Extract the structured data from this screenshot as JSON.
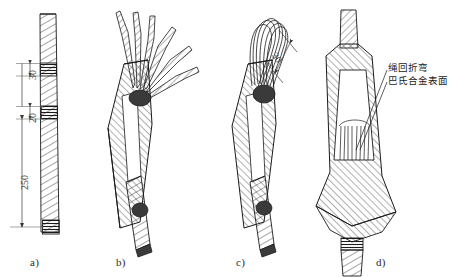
{
  "figure": {
    "background_color": "#ffffff",
    "line_color": "#1a1a1a",
    "panels": [
      {
        "id": "a",
        "label": "a)",
        "caption_x": 30,
        "caption_y": 256
      },
      {
        "id": "b",
        "label": "b)",
        "caption_x": 116,
        "caption_y": 256
      },
      {
        "id": "c",
        "label": "c)",
        "caption_x": 236,
        "caption_y": 256
      },
      {
        "id": "d",
        "label": "d)",
        "caption_x": 376,
        "caption_y": 256
      }
    ],
    "dimensions": [
      {
        "id": "dim-30-top",
        "value": "30",
        "panel": "a",
        "orientation": "vertical"
      },
      {
        "id": "dim-20",
        "value": "20",
        "panel": "a",
        "orientation": "vertical"
      },
      {
        "id": "dim-250",
        "value": "250",
        "panel": "a",
        "orientation": "vertical"
      },
      {
        "id": "dim-30-loop",
        "value": "30",
        "panel": "c",
        "orientation": "diagonal"
      }
    ],
    "annotations": [
      {
        "id": "note-rope-bend",
        "text": "绳回折弯",
        "panel": "d"
      },
      {
        "id": "note-babbitt-surface",
        "text": "巴氏合金表面",
        "panel": "d"
      }
    ]
  }
}
